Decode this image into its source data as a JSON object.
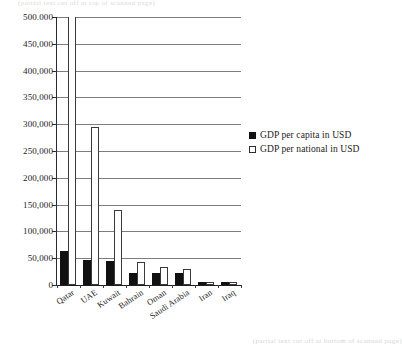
{
  "page": {
    "top_cut_text": "(partial text cut off at top of scanned page)",
    "bottom_cut_text": "(partial text cut off at bottom of scanned page)"
  },
  "legend": {
    "position": "right",
    "items": [
      {
        "label": "GDP per capita in USD",
        "swatch": "filled-square-icon",
        "color": "#111111"
      },
      {
        "label": "GDP per national in USD",
        "swatch": "hollow-square-icon",
        "color": "#ffffff"
      }
    ]
  },
  "chart_data": {
    "type": "bar",
    "title": "",
    "subtitle": "",
    "xlabel": "",
    "ylabel": "",
    "ylim": [
      0,
      500000
    ],
    "grid": true,
    "legend_position": "right",
    "note": "Qatar 'GDP per national in USD' bar is clipped by the plot frame above 450,000.",
    "categories": [
      "Qatar",
      "UAE",
      "Kuwait",
      "Bahrain",
      "Oman",
      "Saudi Arabia",
      "Iran",
      "Iraq"
    ],
    "ytick_labels": [
      "500.000",
      "450,000",
      "400,000",
      "350,000",
      "300,000",
      "250,000",
      "200,000",
      "150,000",
      "100,000",
      "50,000",
      "0"
    ],
    "ytick_values": [
      500000,
      450000,
      400000,
      350000,
      300000,
      250000,
      200000,
      150000,
      100000,
      50000,
      0
    ],
    "series": [
      {
        "name": "GDP per capita in USD",
        "color": "#111111",
        "values": [
          63000,
          46000,
          45000,
          22000,
          23000,
          22000,
          6000,
          5000
        ]
      },
      {
        "name": "GDP per national in USD",
        "color": "#ffffff",
        "values": [
          500000,
          295000,
          140000,
          43000,
          33000,
          30000,
          6500,
          5500
        ]
      }
    ]
  }
}
